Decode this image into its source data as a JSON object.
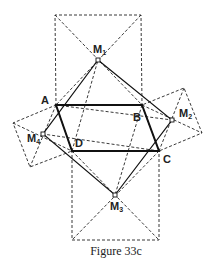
{
  "figure": {
    "caption": "Figure 33c",
    "colors": {
      "stroke": "#222222",
      "background": "#ffffff"
    },
    "points": {
      "A": {
        "label": "A",
        "x": 56,
        "y": 105
      },
      "B": {
        "label": "B",
        "x": 142,
        "y": 105
      },
      "C": {
        "label": "C",
        "x": 159,
        "y": 151
      },
      "D": {
        "label": "D",
        "x": 72,
        "y": 151
      },
      "M1": {
        "label": "M",
        "sub": "1",
        "x": 98,
        "y": 60
      },
      "M2": {
        "label": "M",
        "sub": "2",
        "x": 172,
        "y": 120
      },
      "M3": {
        "label": "M",
        "sub": "3",
        "x": 115,
        "y": 195
      },
      "M4": {
        "label": "M",
        "sub": "4",
        "x": 43,
        "y": 134
      }
    },
    "parallelogram": [
      "A",
      "B",
      "C",
      "D"
    ],
    "squares": [
      {
        "name": "square-on-AB",
        "center": "M1"
      },
      {
        "name": "square-on-BC",
        "center": "M2"
      },
      {
        "name": "square-on-CD",
        "center": "M3"
      },
      {
        "name": "square-on-DA",
        "center": "M4"
      }
    ],
    "inner_quadrilateral": [
      "M1",
      "M2",
      "M3",
      "M4"
    ]
  }
}
